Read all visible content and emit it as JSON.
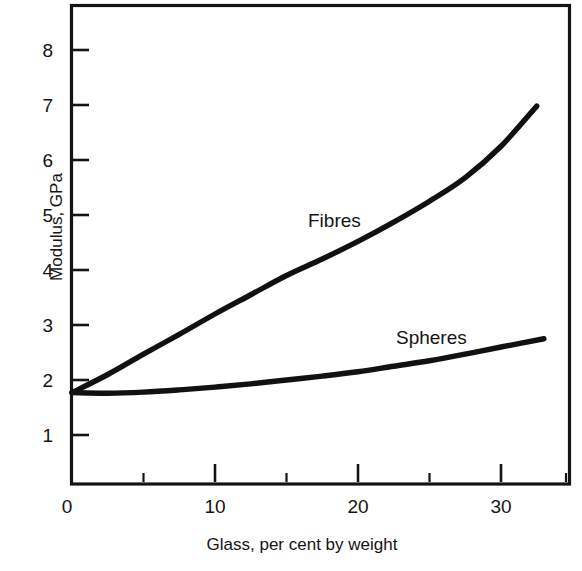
{
  "figure": {
    "background_color": "#ffffff",
    "ink_color": "#141414"
  },
  "chart_data": {
    "type": "line",
    "title": "",
    "subtitle": "",
    "xlabel": "Glass, per cent by weight",
    "ylabel": "Modulus, GPa",
    "xlim": [
      0,
      35
    ],
    "ylim": [
      0,
      8.7
    ],
    "grid": false,
    "legend_position": "inline-annotation",
    "x_ticks_major": [
      0,
      10,
      20,
      30
    ],
    "x_tick_labels": [
      "0",
      "10",
      "20",
      "30"
    ],
    "x_ticks_minor": [
      5,
      15,
      25,
      35
    ],
    "y_ticks_major": [
      1,
      2,
      3,
      4,
      5,
      6,
      7,
      8
    ],
    "y_tick_labels": [
      "1",
      "2",
      "3",
      "4",
      "5",
      "6",
      "7",
      "8"
    ],
    "series": [
      {
        "name": "Fibres",
        "label_text": "Fibres",
        "x": [
          0,
          2.5,
          5,
          7.5,
          10,
          12.5,
          15,
          17.5,
          20,
          22.5,
          25,
          27.5,
          30,
          32.5
        ],
        "values": [
          1.77,
          2.1,
          2.47,
          2.83,
          3.2,
          3.55,
          3.9,
          4.2,
          4.52,
          4.87,
          5.25,
          5.68,
          6.25,
          6.98
        ]
      },
      {
        "name": "Spheres",
        "label_text": "Spheres",
        "x": [
          0,
          2.5,
          5,
          7.5,
          10,
          12.5,
          15,
          17.5,
          20,
          22.5,
          25,
          27.5,
          30,
          33
        ],
        "values": [
          1.77,
          1.76,
          1.78,
          1.82,
          1.87,
          1.93,
          2.0,
          2.07,
          2.15,
          2.25,
          2.35,
          2.47,
          2.6,
          2.75
        ]
      }
    ],
    "annotations": [
      {
        "text": "Fibres",
        "x": 16.5,
        "y": 4.95
      },
      {
        "text": "Spheres",
        "x": 22.0,
        "y": 2.95
      }
    ],
    "axis_frame": "full-box"
  }
}
